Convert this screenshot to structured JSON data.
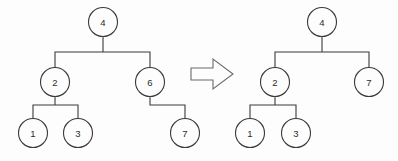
{
  "diagram": {
    "type": "binary-tree-transformation",
    "background_color": "#fdfdfd",
    "stroke_color": "#3a3a3a",
    "label_color": "#2b2b2b",
    "node_radius": 14.5,
    "transform_arrow": {
      "name": "transform-arrow",
      "direction": "right",
      "fill": "#fdfdfd",
      "stroke": "#6a6a6a",
      "points": "191,68 213,68 213,59 233,74 213,89 213,80 191,80"
    },
    "trees": [
      {
        "id": "before",
        "name": "tree-before",
        "nodes": [
          {
            "id": "b-4",
            "label": "4",
            "cx": 103,
            "cy": 22
          },
          {
            "id": "b-2",
            "label": "2",
            "cx": 55,
            "cy": 82
          },
          {
            "id": "b-6",
            "label": "6",
            "cx": 150,
            "cy": 82
          },
          {
            "id": "b-1",
            "label": "1",
            "cx": 33,
            "cy": 133
          },
          {
            "id": "b-3",
            "label": "3",
            "cx": 78,
            "cy": 133
          },
          {
            "id": "b-7",
            "label": "7",
            "cx": 185,
            "cy": 133
          }
        ],
        "edges": [
          {
            "id": "b-e1",
            "name": "edge-4-to-2-6",
            "path": "M 55 67.5 L 55 52 L 150 52 L 150 67.5 M 103 52 L 103 38.5"
          },
          {
            "id": "b-e2",
            "name": "edge-2-to-1-3",
            "path": "M 33 118.5 L 33 105 L 78 105 L 78 118.5 M 55 105 L 55 98.5"
          },
          {
            "id": "b-e3",
            "name": "edge-6-to-7",
            "path": "M 185 118.5 L 185 105 L 150 105 L 150 98.5"
          }
        ],
        "arrowheads": [
          {
            "id": "b-a1",
            "name": "arrowhead-into-4",
            "x": 103,
            "y": 37.5
          },
          {
            "id": "b-a2",
            "name": "arrowhead-into-2",
            "x": 55,
            "y": 97.5
          },
          {
            "id": "b-a3",
            "name": "arrowhead-into-6",
            "x": 150,
            "y": 97.5
          }
        ]
      },
      {
        "id": "after",
        "name": "tree-after",
        "nodes": [
          {
            "id": "a-4",
            "label": "4",
            "cx": 322,
            "cy": 22
          },
          {
            "id": "a-2",
            "label": "2",
            "cx": 275,
            "cy": 82
          },
          {
            "id": "a-7",
            "label": "7",
            "cx": 369,
            "cy": 82
          },
          {
            "id": "a-1",
            "label": "1",
            "cx": 250,
            "cy": 133
          },
          {
            "id": "a-3",
            "label": "3",
            "cx": 296,
            "cy": 133
          }
        ],
        "edges": [
          {
            "id": "a-e1",
            "name": "edge-4-to-2-7",
            "path": "M 275 67.5 L 275 52 L 369 52 L 369 67.5 M 322 52 L 322 38.5"
          },
          {
            "id": "a-e2",
            "name": "edge-2-to-1-3",
            "path": "M 250 118.5 L 250 105 L 296 105 L 296 118.5 M 275 105 L 275 98.5"
          }
        ],
        "arrowheads": [
          {
            "id": "a-a1",
            "name": "arrowhead-into-4",
            "x": 322,
            "y": 37.5
          },
          {
            "id": "a-a2",
            "name": "arrowhead-into-2",
            "x": 275,
            "y": 97.5
          }
        ]
      }
    ]
  }
}
